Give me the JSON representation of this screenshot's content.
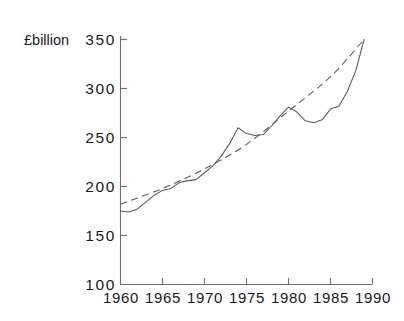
{
  "chart_data": {
    "type": "line",
    "title": "",
    "subtitle": "",
    "xlabel": "",
    "ylabel": "",
    "unit_label": "£billion",
    "xlim": [
      1960,
      1990
    ],
    "ylim": [
      100,
      350
    ],
    "xticks": [
      1960,
      1965,
      1970,
      1975,
      1980,
      1985,
      1990
    ],
    "yticks": [
      100,
      150,
      200,
      250,
      300,
      350
    ],
    "xtick_labels": [
      "1960",
      "1965",
      "1970",
      "1975",
      "1980",
      "1985",
      "1990"
    ],
    "ytick_labels": [
      "100",
      "150",
      "200",
      "250",
      "300",
      "350"
    ],
    "grid": false,
    "legend": "none",
    "axis_color": "#6e6e6e",
    "line_color": "#5a5a5a",
    "series": [
      {
        "name": "actual",
        "style": "solid",
        "x": [
          1960,
          1961,
          1962,
          1963,
          1964,
          1965,
          1966,
          1967,
          1968,
          1969,
          1970,
          1971,
          1972,
          1973,
          1974,
          1975,
          1976,
          1977,
          1978,
          1979,
          1980,
          1981,
          1982,
          1983,
          1984,
          1985,
          1986,
          1987,
          1988,
          1989
        ],
        "values": [
          175,
          174,
          177,
          184,
          191,
          196,
          198,
          204,
          206,
          207,
          214,
          221,
          231,
          244,
          260,
          254,
          252,
          253,
          262,
          272,
          281,
          276,
          267,
          265,
          268,
          279,
          282,
          297,
          318,
          350
        ]
      },
      {
        "name": "trend",
        "style": "dashed",
        "x": [
          1960,
          1965,
          1970,
          1975,
          1980,
          1985,
          1989
        ],
        "values": [
          182,
          198,
          218,
          243,
          277,
          312,
          350
        ]
      }
    ]
  }
}
